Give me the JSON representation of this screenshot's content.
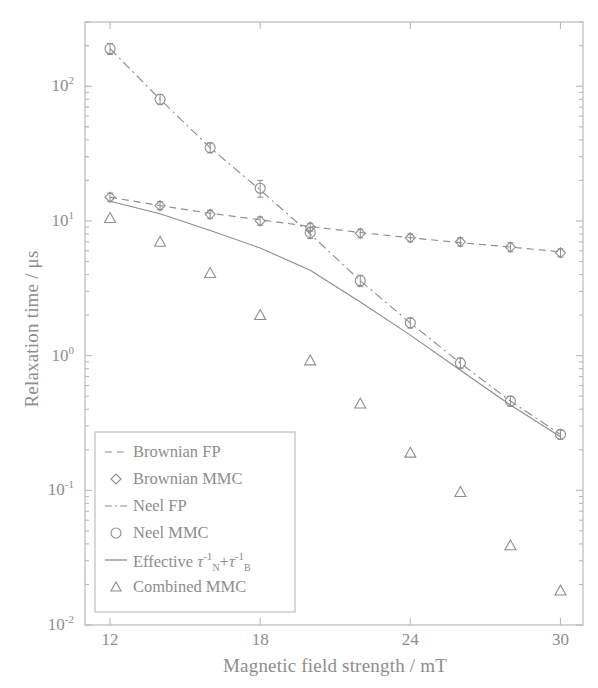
{
  "chart_data": {
    "type": "line",
    "title": "",
    "xlabel": "Magnetic field strength / mT",
    "ylabel": "Relaxation time / μs",
    "xlim": [
      11.0,
      30.9
    ],
    "ylim": [
      0.01,
      300
    ],
    "yscale": "log",
    "xscale": "linear",
    "grid": false,
    "xticks": [
      12,
      18,
      24,
      30
    ],
    "xtick_labels": [
      "12",
      "18",
      "24",
      "30"
    ],
    "yticks": [
      0.01,
      0.1,
      1,
      10,
      100
    ],
    "ytick_labels": [
      "10-2",
      "10-1",
      "100",
      "101",
      "102"
    ],
    "legend_position": "lower left",
    "series": [
      {
        "name": "Brownian FP",
        "style": "dashed-line",
        "color": "#8d8d8d",
        "x": [
          12,
          14,
          16,
          18,
          20,
          22,
          24,
          26,
          28,
          30
        ],
        "values": [
          15.0,
          13.0,
          11.4,
          10.2,
          9.1,
          8.2,
          7.5,
          6.9,
          6.4,
          5.9
        ]
      },
      {
        "name": "Brownian MMC",
        "style": "marker-diamond",
        "color": "#8d8d8d",
        "x": [
          12,
          14,
          16,
          18,
          20,
          22,
          24,
          26,
          28,
          30
        ],
        "values": [
          15.0,
          13.0,
          11.2,
          10.0,
          9.0,
          8.1,
          7.5,
          7.0,
          6.4,
          5.8
        ],
        "errors": [
          1.1,
          0.9,
          0.8,
          0.7,
          0.6,
          0.6,
          0.5,
          0.5,
          0.5,
          0.4
        ]
      },
      {
        "name": "Neel FP",
        "style": "dash-dot-line",
        "color": "#8d8d8d",
        "x": [
          12,
          14,
          16,
          18,
          20,
          22,
          24,
          26,
          28,
          30
        ],
        "values": [
          190,
          80,
          35,
          17,
          8.0,
          3.6,
          1.75,
          0.88,
          0.46,
          0.26
        ]
      },
      {
        "name": "Neel MMC",
        "style": "marker-circle",
        "color": "#8d8d8d",
        "x": [
          12,
          14,
          16,
          18,
          20,
          22,
          24,
          26,
          28,
          30
        ],
        "values": [
          190,
          80,
          35,
          17.5,
          8.2,
          3.6,
          1.75,
          0.88,
          0.46,
          0.26
        ],
        "errors": [
          18,
          7,
          3,
          2.5,
          0.8,
          0.35,
          0.15,
          0.08,
          0.04,
          0.02
        ]
      },
      {
        "name": "Effective tauN-1 + tauB-1",
        "style": "solid-line",
        "color": "#8d8d8d",
        "x": [
          12,
          14,
          16,
          18,
          20,
          22,
          24,
          26,
          28,
          30
        ],
        "values": [
          14.0,
          11.3,
          8.5,
          6.3,
          4.3,
          2.5,
          1.42,
          0.78,
          0.43,
          0.25
        ]
      },
      {
        "name": "Combined MMC",
        "style": "marker-triangle",
        "color": "#8d8d8d",
        "x": [
          12,
          14,
          16,
          18,
          20,
          22,
          24,
          26,
          28,
          30
        ],
        "values": [
          10.5,
          7.0,
          4.1,
          2.0,
          0.92,
          0.44,
          0.19,
          0.097,
          0.039,
          0.018
        ]
      }
    ]
  },
  "axes": {
    "ylabel": "Relaxation time / μs",
    "xlabel": "Magnetic field strength / mT",
    "xtick_labels": [
      "12",
      "18",
      "24",
      "30"
    ],
    "ytick_mantissa": "10",
    "ytick_exponents": [
      "2",
      "1",
      "0",
      "-1",
      "-2"
    ]
  },
  "legend": {
    "entries": [
      {
        "label": "Brownian FP",
        "marker": "dashed-line"
      },
      {
        "label": "Brownian MMC",
        "marker": "diamond"
      },
      {
        "label": "Neel FP",
        "marker": "dash-dot-line"
      },
      {
        "label": "Neel MMC",
        "marker": "circle"
      },
      {
        "label": "Effective",
        "marker": "solid-line",
        "math_tau": "τ",
        "math_sub1": "N",
        "math_sup1": "-1",
        "math_plus": "+",
        "math_sub2": "B",
        "math_sup2": "-1"
      },
      {
        "label": "Combined MMC",
        "marker": "triangle"
      }
    ]
  }
}
